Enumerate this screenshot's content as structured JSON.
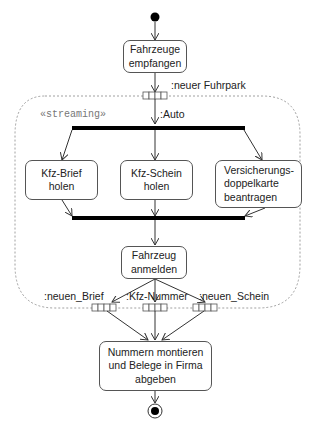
{
  "diagram": {
    "type": "UML activity diagram",
    "region_stereotype": "«streaming»",
    "colors": {
      "stroke": "#555555",
      "bar": "#000000",
      "region_border": "#888888",
      "text": "#222222"
    },
    "actions": [
      {
        "id": "a1",
        "label": "Fahrzeuge\nempfangen"
      },
      {
        "id": "a2",
        "label": "Kfz-Brief\nholen"
      },
      {
        "id": "a3",
        "label": "Kfz-Schein\nholen"
      },
      {
        "id": "a4",
        "label": "Versicherungs-\ndoppelkarte\nbeantragen"
      },
      {
        "id": "a5",
        "label": "Fahrzeug\nanmelden"
      },
      {
        "id": "a6",
        "label": "Nummern montieren\nund Belege in Firma\nabgeben"
      }
    ],
    "pins": {
      "input_label": ":neuer Fuhrpark",
      "inner_label": ":Auto",
      "outputs": [
        ":neuen_Brief",
        ":Kfz-Nummer",
        ":neuen_Schein"
      ]
    },
    "nodes": {
      "initial": "initial-node",
      "final": "activity-final-node",
      "fork": "fork-bar",
      "join": "join-bar"
    }
  }
}
